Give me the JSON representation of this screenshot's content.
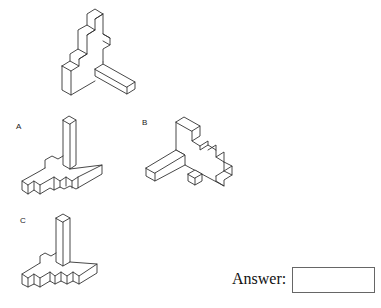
{
  "question": {
    "type": "mental-rotation",
    "reference_figure": "isometric-block-staircase-with-bar"
  },
  "options": [
    {
      "label": "A"
    },
    {
      "label": "B"
    },
    {
      "label": "C"
    }
  ],
  "answer": {
    "label": "Answer:",
    "value": ""
  }
}
